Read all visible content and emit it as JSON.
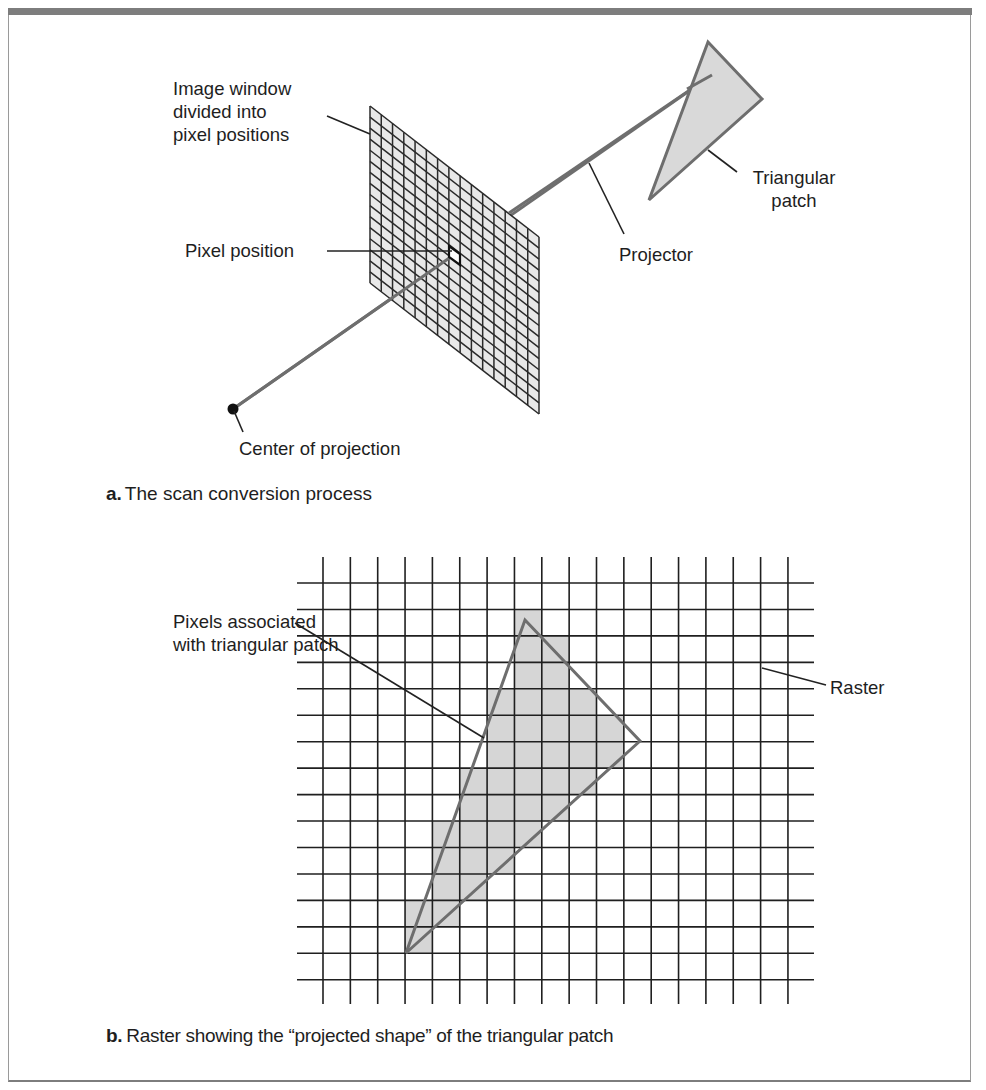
{
  "figure_a": {
    "labels": {
      "image_window": [
        "Image window",
        "divided into",
        "pixel positions"
      ],
      "pixel_position": "Pixel position",
      "projector": "Projector",
      "triangular_patch": [
        "Triangular",
        "patch"
      ],
      "center_of_projection": "Center of projection"
    },
    "caption": {
      "letter": "a.",
      "text": "The scan conversion process"
    },
    "image_window_grid": {
      "columns": 15,
      "rows": 16
    },
    "colors": {
      "grid_fill": "#e8e8e8",
      "grid_line": "#2a2a2a",
      "projector": "#6e6e6e",
      "patch_fill": "#d9d9d9",
      "patch_stroke": "#6e6e6e"
    }
  },
  "figure_b": {
    "labels": {
      "pixels_associated": [
        "Pixels associated",
        "with triangular patch"
      ],
      "raster": "Raster"
    },
    "caption": {
      "letter": "b.",
      "text": "Raster showing the “projected shape” of the triangular patch"
    },
    "raster": {
      "vertical_lines": 18,
      "horizontal_lines": 16,
      "shaded_cells_by_row": {
        "1": [
          7
        ],
        "2": [
          7,
          8
        ],
        "3": [
          7,
          8
        ],
        "4": [
          6,
          7,
          8,
          9
        ],
        "5": [
          6,
          7,
          8,
          9,
          10
        ],
        "6": [
          6,
          7,
          8,
          9,
          10
        ],
        "7": [
          5,
          6,
          7,
          8,
          9
        ],
        "8": [
          5,
          6,
          7,
          8
        ],
        "9": [
          4,
          5,
          6,
          7
        ],
        "10": [
          4,
          5,
          6
        ],
        "11": [
          4,
          5
        ],
        "12": [
          3,
          4
        ],
        "13": [
          3
        ]
      }
    },
    "colors": {
      "shade": "#d6d6d6",
      "grid_line": "#1f1f1f",
      "triangle_stroke": "#6e6e6e"
    }
  }
}
